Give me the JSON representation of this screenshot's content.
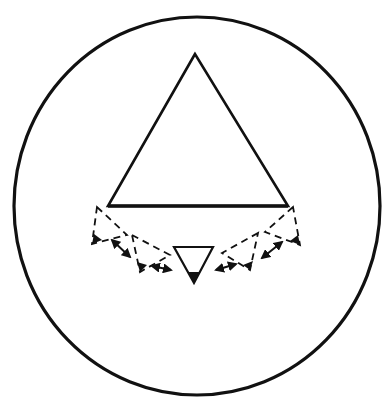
{
  "diagram": {
    "width": 391,
    "height": 406,
    "stroke_color": "#111111",
    "background": "#ffffff",
    "outer_circle": {
      "cx": 197,
      "cy": 206,
      "rx": 183,
      "ry": 189,
      "stroke_width": 3.2
    },
    "large_triangle": {
      "points": "195,54 108,206 288,206",
      "stroke_width": 2.6
    },
    "base_line": {
      "x1": 108,
      "y1": 206,
      "x2": 288,
      "y2": 206,
      "stroke_width": 3.4
    },
    "center_triangle": {
      "points": "174,247 213,247 194,283",
      "tip": "194,283 188,272 200,272",
      "stroke_width": 2.2
    },
    "dashed_triangles": [
      {
        "id": "left-outer",
        "points": "97,207 127,235 92,244",
        "tip": "92,244 94,234 102,240"
      },
      {
        "id": "left-inner",
        "points": "132,235 170,255 140,272",
        "tip": "140,272 137,262 147,265"
      },
      {
        "id": "right-inner",
        "points": "258,233 222,253 250,270",
        "tip": "250,270 243,265 253,261"
      },
      {
        "id": "right-outer",
        "points": "293,207 265,232 300,245",
        "tip": "300,245 290,241 298,235"
      }
    ],
    "dash_pattern": "7,5",
    "dashed_stroke_width": 1.8,
    "double_arrows": [
      {
        "id": "arrow-1",
        "x1": 112,
        "y1": 240,
        "x2": 130,
        "y2": 257
      },
      {
        "id": "arrow-2",
        "x1": 152,
        "y1": 266,
        "x2": 171,
        "y2": 270
      },
      {
        "id": "arrow-3",
        "x1": 216,
        "y1": 270,
        "x2": 236,
        "y2": 264
      },
      {
        "id": "arrow-4",
        "x1": 262,
        "y1": 258,
        "x2": 282,
        "y2": 242
      }
    ]
  }
}
